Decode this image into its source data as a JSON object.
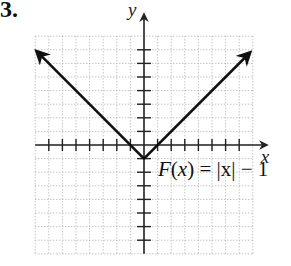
{
  "problem": {
    "number": "3."
  },
  "chart_data": {
    "type": "line",
    "title": "",
    "function_label": "F(x) = |x| − 1",
    "function_parts": {
      "name": "F",
      "var": "x",
      "rhs": "= |x| − 1"
    },
    "xlabel": "x",
    "ylabel": "y",
    "xlim": [
      -8,
      8
    ],
    "ylim": [
      -8,
      8
    ],
    "grid": true,
    "tick_spacing": 1,
    "series": [
      {
        "name": "F(x) = |x| - 1",
        "x": [
          -8,
          -7,
          -6,
          -5,
          -4,
          -3,
          -2,
          -1,
          0,
          1,
          2,
          3,
          4,
          5,
          6,
          7,
          8
        ],
        "y": [
          7,
          6,
          5,
          4,
          3,
          2,
          1,
          0,
          -1,
          0,
          1,
          2,
          3,
          4,
          5,
          6,
          7
        ],
        "arrows": "both-ends",
        "vertex": [
          0,
          -1
        ]
      }
    ]
  },
  "colors": {
    "line": "#111111",
    "grid": "#b8b8b8",
    "axis": "#222222"
  }
}
